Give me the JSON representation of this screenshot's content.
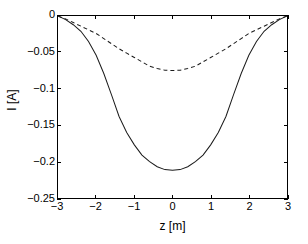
{
  "chart_data": {
    "type": "line",
    "title": "",
    "xlabel": "z [m]",
    "ylabel": "I [A]",
    "xlim": [
      -3,
      3
    ],
    "ylim": [
      -0.25,
      0
    ],
    "xticks": [
      -3,
      -2,
      -1,
      0,
      1,
      2,
      3
    ],
    "xticklabels": [
      "−3",
      "−2",
      "−1",
      "0",
      "1",
      "2",
      "3"
    ],
    "yticks": [
      0,
      -0.05,
      -0.1,
      -0.15,
      -0.2,
      -0.25
    ],
    "yticklabels": [
      "0",
      "−0.05",
      "−0.1",
      "−0.15",
      "−0.2",
      "−0.25"
    ],
    "grid": false,
    "legend": null,
    "line_color": "#1a1a1a",
    "axis_color": "#000000",
    "background": "#ffffff",
    "series": [
      {
        "name": "solid-curve",
        "style": "solid",
        "color": "#1a1a1a",
        "x": [
          -3,
          -2.8,
          -2.6,
          -2.4,
          -2.2,
          -2,
          -1.8,
          -1.6,
          -1.4,
          -1.2,
          -1,
          -0.8,
          -0.6,
          -0.4,
          -0.2,
          0,
          0.2,
          0.4,
          0.6,
          0.8,
          1,
          1.2,
          1.4,
          1.6,
          1.8,
          2,
          2.2,
          2.4,
          2.6,
          2.8,
          3
        ],
        "values": [
          0,
          -0.005,
          -0.012,
          -0.021,
          -0.035,
          -0.054,
          -0.079,
          -0.108,
          -0.138,
          -0.16,
          -0.177,
          -0.191,
          -0.2,
          -0.207,
          -0.211,
          -0.212,
          -0.211,
          -0.207,
          -0.2,
          -0.191,
          -0.177,
          -0.16,
          -0.138,
          -0.108,
          -0.079,
          -0.054,
          -0.035,
          -0.021,
          -0.012,
          -0.005,
          0
        ]
      },
      {
        "name": "dashed-curve",
        "style": "dashed",
        "color": "#1a1a1a",
        "x": [
          -3,
          -2.8,
          -2.6,
          -2.4,
          -2.2,
          -2,
          -1.8,
          -1.6,
          -1.4,
          -1.2,
          -1,
          -0.8,
          -0.6,
          -0.4,
          -0.2,
          0,
          0.2,
          0.4,
          0.6,
          0.8,
          1,
          1.2,
          1.4,
          1.6,
          1.8,
          2,
          2.2,
          2.4,
          2.6,
          2.8,
          3
        ],
        "values": [
          0,
          -0.004,
          -0.009,
          -0.014,
          -0.019,
          -0.024,
          -0.031,
          -0.038,
          -0.045,
          -0.051,
          -0.057,
          -0.063,
          -0.069,
          -0.072,
          -0.0745,
          -0.075,
          -0.0745,
          -0.072,
          -0.069,
          -0.063,
          -0.057,
          -0.051,
          -0.045,
          -0.038,
          -0.031,
          -0.024,
          -0.019,
          -0.014,
          -0.009,
          -0.004,
          0
        ]
      }
    ]
  }
}
